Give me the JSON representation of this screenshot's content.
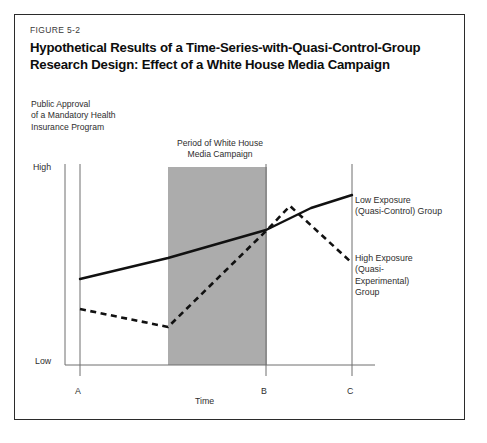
{
  "figure": {
    "number_label": "FIGURE 5-2",
    "title_line1": "Hypothetical Results of a Time-Series-with-Quasi-Control-Group",
    "title_line2": "Research Design: Effect of a White House Media Campaign"
  },
  "y_caption": {
    "line1": "Public Approval",
    "line2": "of a Mandatory Health",
    "line3": "Insurance Program"
  },
  "band_caption": {
    "line1": "Period of White House",
    "line2": "Media Campaign"
  },
  "axis": {
    "y_high": "High",
    "y_low": "Low",
    "x_title": "Time",
    "x_tick_a": "A",
    "x_tick_b": "B",
    "x_tick_c": "C"
  },
  "legend": {
    "low_exposure_line1": "Low Exposure",
    "low_exposure_line2": "(Quasi-Control) Group",
    "high_exposure_line1": "High Exposure",
    "high_exposure_line2": "(Quasi-",
    "high_exposure_line3": "Experimental)",
    "high_exposure_line4": "Group"
  },
  "colors": {
    "frame": "#2b2b2b",
    "band_fill": "#acacac",
    "series_line": "#111111",
    "axis_line": "#6e6e6e",
    "text": "#2e2e2e"
  },
  "chart_data": {
    "type": "line",
    "title": "Hypothetical Results of a Time-Series-with-Quasi-Control-Group Research Design: Effect of a White House Media Campaign",
    "xlabel": "Time",
    "ylabel": "Public Approval of a Mandatory Health Insurance Program",
    "x_tick_labels": [
      "A",
      "B",
      "C"
    ],
    "y_tick_labels": [
      "Low",
      "High"
    ],
    "grid": false,
    "legend_position": "right",
    "annotations": [
      {
        "text": "Period of White House Media Campaign",
        "type": "shaded-band",
        "x_start_frac": 0.44,
        "x_end_frac": 0.72
      }
    ],
    "series": [
      {
        "name": "Low Exposure (Quasi-Control) Group",
        "style": "solid",
        "points": [
          {
            "x": 79,
            "y": 278
          },
          {
            "x": 167,
            "y": 257
          },
          {
            "x": 265,
            "y": 229
          },
          {
            "x": 310,
            "y": 207
          },
          {
            "x": 351,
            "y": 194
          }
        ]
      },
      {
        "name": "High Exposure (Quasi-Experimental) Group",
        "style": "dashed",
        "points": [
          {
            "x": 79,
            "y": 308
          },
          {
            "x": 167,
            "y": 326
          },
          {
            "x": 265,
            "y": 230
          },
          {
            "x": 289,
            "y": 205
          },
          {
            "x": 351,
            "y": 262
          }
        ]
      }
    ]
  }
}
